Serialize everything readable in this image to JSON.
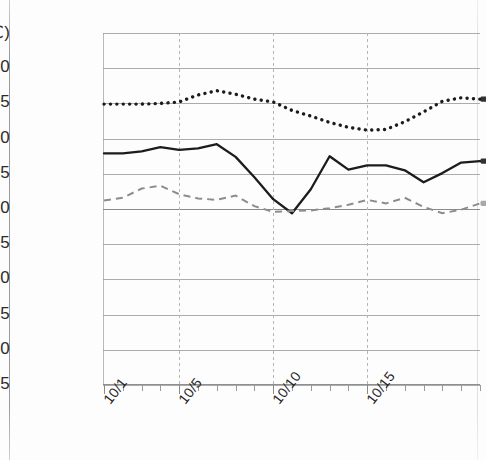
{
  "chart_data": {
    "type": "line",
    "title": "",
    "subtitle": "",
    "xlabel": "",
    "ylabel": "25(℃)",
    "unit_label": "(℃)",
    "ylim": [
      -25,
      25
    ],
    "ytick_step": 5,
    "yticks": [
      "25(℃)",
      "20",
      "15",
      "10",
      "5",
      "0",
      "-5",
      "-10",
      "-15",
      "-20",
      "-25"
    ],
    "ytick_values": [
      25,
      20,
      15,
      10,
      5,
      0,
      -5,
      -10,
      -15,
      -20,
      -25
    ],
    "grid": "horizontal-solid-and-vertical-dashed",
    "legend": "none",
    "x": [
      "10/1",
      "10/2",
      "10/3",
      "10/4",
      "10/5",
      "10/6",
      "10/7",
      "10/8",
      "10/9",
      "10/10",
      "10/11",
      "10/12",
      "10/13",
      "10/14",
      "10/15",
      "10/16",
      "10/17",
      "10/18",
      "10/19",
      "10/20",
      "10/21"
    ],
    "xtick_labels": [
      "10/1",
      "10/5",
      "10/10",
      "10/15"
    ],
    "xtick_label_indices": [
      0,
      4,
      9,
      14
    ],
    "xtick_label_rotation": -52,
    "series": [
      {
        "name": "maximum-temperature",
        "style": "dotted",
        "color": "#1c1c1c",
        "values": [
          14.9,
          14.9,
          14.9,
          15.0,
          15.2,
          16.2,
          16.8,
          16.3,
          15.6,
          15.2,
          14.0,
          13.2,
          12.3,
          11.6,
          11.2,
          11.3,
          12.4,
          13.8,
          15.3,
          15.8,
          15.6
        ]
      },
      {
        "name": "mean-temperature",
        "style": "solid",
        "color": "#1c1c1c",
        "values": [
          7.9,
          7.9,
          8.2,
          8.8,
          8.4,
          8.6,
          9.2,
          7.4,
          4.5,
          1.4,
          -0.6,
          2.8,
          7.5,
          5.6,
          6.2,
          6.2,
          5.5,
          3.8,
          5.1,
          6.6,
          6.8
        ]
      },
      {
        "name": "minimum-temperature",
        "style": "dashed",
        "color": "#8c8c8c",
        "values": [
          1.2,
          1.6,
          2.9,
          3.3,
          2.1,
          1.5,
          1.3,
          1.9,
          0.4,
          -0.4,
          -0.3,
          -0.2,
          0.1,
          0.6,
          1.3,
          0.8,
          1.6,
          0.3,
          -0.6,
          -0.1,
          0.8
        ]
      }
    ]
  },
  "figure": {
    "yaxis_unit": "℃",
    "plot_origin_note": ""
  }
}
